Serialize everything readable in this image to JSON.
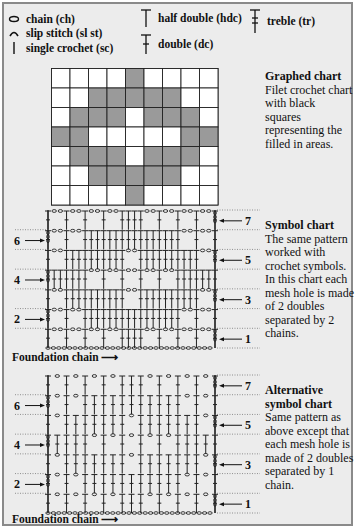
{
  "legend": [
    {
      "icon": "chain-icon",
      "label": "chain (ch)"
    },
    {
      "icon": "slip-stitch-icon",
      "label": "slip stitch (sl st)"
    },
    {
      "icon": "single-crochet-icon",
      "label": "single crochet (sc)"
    },
    {
      "icon": "half-double-icon",
      "label": "half double (hdc)"
    },
    {
      "icon": "double-icon",
      "label": "double (dc)"
    },
    {
      "icon": "treble-icon",
      "label": "treble (tr)"
    }
  ],
  "graphed_chart": {
    "title": "Graphed chart",
    "description": "Filet crochet chart with black squares representing the filled in areas.",
    "columns": 9,
    "rows": 7,
    "filled": [
      [
        0,
        0,
        0,
        0,
        1,
        0,
        0,
        0,
        0
      ],
      [
        0,
        0,
        1,
        1,
        1,
        1,
        1,
        0,
        0
      ],
      [
        0,
        1,
        1,
        1,
        0,
        1,
        1,
        1,
        0
      ],
      [
        1,
        1,
        0,
        0,
        0,
        0,
        0,
        1,
        1
      ],
      [
        0,
        1,
        1,
        1,
        0,
        1,
        1,
        1,
        0
      ],
      [
        0,
        0,
        1,
        1,
        1,
        1,
        1,
        0,
        0
      ],
      [
        0,
        0,
        0,
        0,
        1,
        0,
        0,
        0,
        0
      ]
    ],
    "fill_color": "#9a9a9a"
  },
  "symbol_chart": {
    "title": "Symbol chart",
    "description": "The same pattern worked with crochet symbols. In this chart each mesh hole is made of 2 doubles separated by 2 chains.",
    "right_row_labels": [
      "7",
      "5",
      "3",
      "1"
    ],
    "left_row_labels": [
      "6",
      "4",
      "2"
    ],
    "foundation_label": "Foundation chain"
  },
  "alt_symbol_chart": {
    "title": "Alternative symbol chart",
    "description": "Same pattern as above except that each mesh hole is made of 2 doubles separated by 1 chain.",
    "right_row_labels": [
      "7",
      "5",
      "3",
      "1"
    ],
    "left_row_labels": [
      "6",
      "4",
      "2"
    ],
    "foundation_label": "Foundation chain"
  }
}
